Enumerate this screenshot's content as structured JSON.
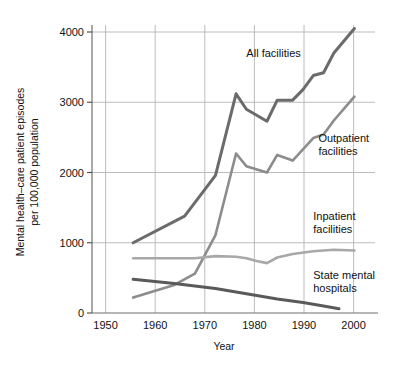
{
  "chart_data": {
    "type": "line",
    "title": "",
    "xlabel": "Year",
    "ylabel": "Mental health–care patient episodes per 100,000 population",
    "ylabel_line1": "Mental health–care patient episodes",
    "ylabel_line2": "per 100,000 population",
    "xlim": [
      1947,
      2002
    ],
    "ylim": [
      0,
      4200
    ],
    "xticks": [
      1950,
      1960,
      1970,
      1980,
      1990,
      2000
    ],
    "xtick_labels": [
      "1950",
      "1960",
      "1970",
      "1980",
      "1990",
      "2000"
    ],
    "yticks": [
      0,
      1000,
      2000,
      3000,
      4000
    ],
    "ytick_labels": [
      "0",
      "1000",
      "2000",
      "3000",
      "4000"
    ],
    "grid": "both",
    "legend_position": "inline-annotations",
    "series": [
      {
        "name": "All facilities",
        "color": "#6b6b6b",
        "linewidth": 3.0,
        "label_x": 1977,
        "label_y": 3640,
        "x": [
          1955,
          1965,
          1971,
          1975,
          1977,
          1981,
          1983,
          1986,
          1988,
          1990,
          1992,
          1994,
          1998
        ],
        "y": [
          1000,
          1380,
          1960,
          3120,
          2900,
          2730,
          3030,
          3030,
          3180,
          3380,
          3420,
          3700,
          4050
        ]
      },
      {
        "name": "Outpatient facilities",
        "color": "#8c8c8c",
        "linewidth": 2.6,
        "label_x": 1991,
        "label_y": 2440,
        "x": [
          1955,
          1963,
          1967,
          1971,
          1975,
          1977,
          1981,
          1983,
          1986,
          1990,
          1992,
          1994,
          1998
        ],
        "y": [
          220,
          400,
          560,
          1110,
          2270,
          2090,
          2000,
          2250,
          2170,
          2490,
          2540,
          2740,
          3080
        ]
      },
      {
        "name": "Inpatient facilities",
        "color": "#a8a8a8",
        "linewidth": 2.6,
        "label_x": 1990,
        "label_y": 1320,
        "x": [
          1955,
          1967,
          1971,
          1975,
          1977,
          1979,
          1981,
          1983,
          1986,
          1990,
          1994,
          1998
        ],
        "y": [
          780,
          780,
          810,
          800,
          780,
          740,
          710,
          790,
          840,
          880,
          900,
          890
        ]
      },
      {
        "name": "State mental hospitals",
        "color": "#5a5a5a",
        "linewidth": 3.0,
        "label_x": 1990,
        "label_y": 480,
        "x": [
          1955,
          1963,
          1971,
          1975,
          1979,
          1983,
          1988,
          1992,
          1995
        ],
        "y": [
          480,
          420,
          350,
          300,
          250,
          200,
          150,
          100,
          60
        ]
      }
    ],
    "series_labels": [
      {
        "name": "All facilities",
        "lines": [
          "All facilities"
        ]
      },
      {
        "name": "Outpatient facilities",
        "lines": [
          "Outpatient",
          "facilities"
        ]
      },
      {
        "name": "Inpatient facilities",
        "lines": [
          "Inpatient",
          "facilities"
        ]
      },
      {
        "name": "State mental hospitals",
        "lines": [
          "State mental",
          "hospitals"
        ]
      }
    ]
  }
}
